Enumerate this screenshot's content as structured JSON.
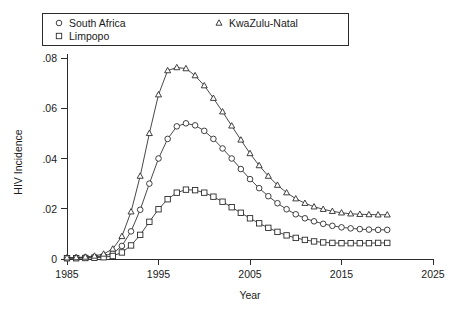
{
  "chart_data": {
    "type": "line",
    "title": "",
    "xlabel": "Year",
    "ylabel": "HIV Incidence",
    "xlim": [
      1985,
      2025
    ],
    "ylim": [
      0,
      0.088
    ],
    "grid": false,
    "legend_position": "top",
    "xticks": [
      "1985",
      "1995",
      "2005",
      "2015",
      "2025"
    ],
    "xtick_values": [
      1985,
      1995,
      2005,
      2015,
      2025
    ],
    "yticks": [
      "0",
      ".02",
      ".04",
      ".06",
      ".08"
    ],
    "ytick_values": [
      0,
      0.02,
      0.04,
      0.06,
      0.08
    ],
    "x": [
      1985,
      1986,
      1987,
      1988,
      1989,
      1990,
      1991,
      1992,
      1993,
      1994,
      1995,
      1996,
      1997,
      1998,
      1999,
      2000,
      2001,
      2002,
      2003,
      2004,
      2005,
      2006,
      2007,
      2008,
      2009,
      2010,
      2011,
      2012,
      2013,
      2014,
      2015,
      2016,
      2017,
      2018,
      2019,
      2020
    ],
    "series": [
      {
        "name": "South Africa",
        "marker": "circle",
        "values": [
          0.0004,
          0.0005,
          0.0006,
          0.0008,
          0.0012,
          0.0022,
          0.0052,
          0.011,
          0.0196,
          0.03,
          0.04,
          0.0478,
          0.0528,
          0.054,
          0.0532,
          0.051,
          0.0478,
          0.044,
          0.04,
          0.0358,
          0.0318,
          0.0282,
          0.025,
          0.0222,
          0.0198,
          0.0178,
          0.0162,
          0.015,
          0.014,
          0.0132,
          0.0126,
          0.0122,
          0.0119,
          0.0117,
          0.0116,
          0.0116
        ]
      },
      {
        "name": "Limpopo",
        "marker": "square",
        "values": [
          0.0003,
          0.0003,
          0.0004,
          0.0005,
          0.0007,
          0.0012,
          0.0026,
          0.0054,
          0.0096,
          0.0148,
          0.0198,
          0.0238,
          0.0264,
          0.0276,
          0.0274,
          0.0264,
          0.0248,
          0.0228,
          0.0206,
          0.0184,
          0.0162,
          0.0142,
          0.0124,
          0.0108,
          0.0094,
          0.0084,
          0.0076,
          0.007,
          0.0066,
          0.0064,
          0.0063,
          0.0063,
          0.0063,
          0.0063,
          0.0064,
          0.0064
        ]
      },
      {
        "name": "KwaZulu-Natal",
        "marker": "triangle",
        "values": [
          0.0005,
          0.0006,
          0.0008,
          0.0012,
          0.002,
          0.004,
          0.009,
          0.0188,
          0.033,
          0.05,
          0.0654,
          0.075,
          0.0762,
          0.0758,
          0.073,
          0.069,
          0.064,
          0.0586,
          0.053,
          0.0474,
          0.042,
          0.0372,
          0.033,
          0.0294,
          0.0264,
          0.024,
          0.0222,
          0.0208,
          0.0198,
          0.019,
          0.0184,
          0.018,
          0.0178,
          0.0177,
          0.0176,
          0.0176
        ]
      }
    ]
  },
  "legend": {
    "entries": [
      {
        "label": "South Africa",
        "marker": "circle-marker-icon"
      },
      {
        "label": "Limpopo",
        "marker": "square-marker-icon"
      },
      {
        "label": "KwaZulu-Natal",
        "marker": "triangle-marker-icon"
      }
    ]
  },
  "axes": {
    "x_title": "Year",
    "y_title": "HIV Incidence"
  },
  "colors": {
    "line": "#333333",
    "marker_fill": "#ffffff",
    "axis": "#2b2b2b",
    "background": "#ffffff"
  }
}
